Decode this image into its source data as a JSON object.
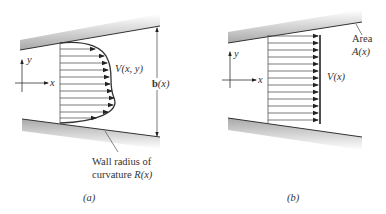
{
  "panels": [
    {
      "id": "a",
      "caption": "(a)",
      "velocity_label": "V(x, y)",
      "height_label_bold": "b",
      "height_label_rest": "(x)",
      "wall_label_line1": "Wall radius of",
      "wall_label_line2_prefix": "curvature ",
      "wall_label_line2_symbol": "R(x)",
      "axis_x": "x",
      "axis_y": "y",
      "profile": "parabolic-like nonuniform velocity profile"
    },
    {
      "id": "b",
      "caption": "(b)",
      "velocity_label": "V(x)",
      "area_label_line1": "Area",
      "area_label_line2": "A(x)",
      "axis_x": "x",
      "axis_y": "y",
      "profile": "uniform velocity profile"
    }
  ],
  "colors": {
    "line": "#333333",
    "wall_shade": "#bdbdbd",
    "arrow": "#222222"
  }
}
